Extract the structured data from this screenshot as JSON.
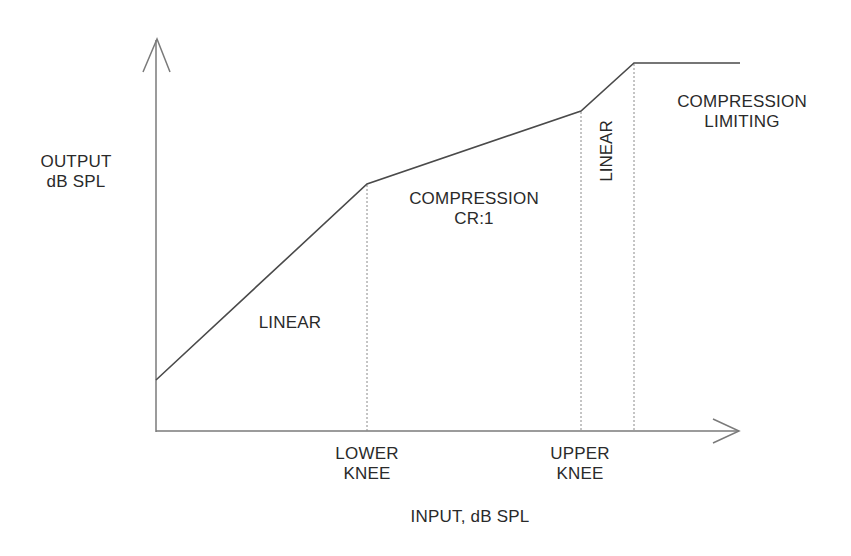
{
  "diagram": {
    "y_axis": {
      "label_line1": "OUTPUT",
      "label_line2": "dB SPL"
    },
    "x_axis": {
      "label": "INPUT, dB SPL"
    },
    "knees": {
      "lower": {
        "line1": "LOWER",
        "line2": "KNEE"
      },
      "upper": {
        "line1": "UPPER",
        "line2": "KNEE"
      }
    },
    "regions": {
      "linear_low": "LINEAR",
      "compression": {
        "line1": "COMPRESSION",
        "line2": "CR:1"
      },
      "linear_mid": "LINEAR",
      "limiting": {
        "line1": "COMPRESSION",
        "line2": "LIMITING"
      }
    },
    "curve_points_px": [
      [
        156,
        380
      ],
      [
        367,
        184
      ],
      [
        581,
        111
      ],
      [
        634,
        63
      ],
      [
        740,
        63
      ]
    ],
    "colors": {
      "line": "#4a4a4a",
      "axis": "#7a7a7a",
      "dotted": "#8a8a8a",
      "text": "#2a2a2a"
    }
  }
}
